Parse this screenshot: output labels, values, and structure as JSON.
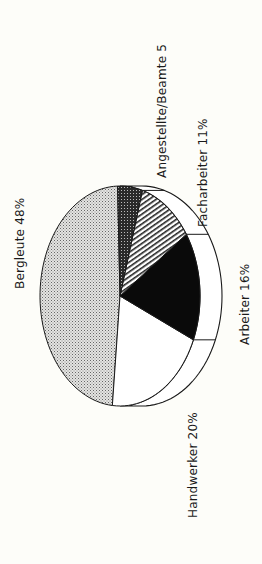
{
  "chart_data": {
    "type": "pie",
    "title": "",
    "style": "3d-tilted, rotated 90deg counter-clockwise, monochrome patterns",
    "slices": [
      {
        "label": "Bergleute",
        "value": 48,
        "display": "Bergleute 48%",
        "pattern": "dotted-gray"
      },
      {
        "label": "Handwerker",
        "value": 20,
        "display": "Handwerker 20%",
        "pattern": "white"
      },
      {
        "label": "Arbeiter",
        "value": 16,
        "display": "Arbeiter 16%",
        "pattern": "black"
      },
      {
        "label": "Facharbeiter",
        "value": 11,
        "display": "Facharbeiter 11%",
        "pattern": "diagonal-hatch"
      },
      {
        "label": "Angestellte/Beamte",
        "value": 5,
        "display": "Angestellte/Beamte 5",
        "pattern": "dark-crosshatch"
      }
    ],
    "categories": [
      "Bergleute",
      "Handwerker",
      "Arbeiter",
      "Facharbeiter",
      "Angestellte/Beamte"
    ],
    "values": [
      48,
      20,
      16,
      11,
      5
    ],
    "unit": "%"
  },
  "colors": {
    "background": "#fdfdf9",
    "outline": "#1a1a1a",
    "dotted": "#c8c8c8",
    "black": "#0a0a0a"
  }
}
